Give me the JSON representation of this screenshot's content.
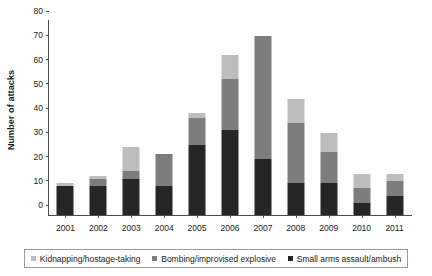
{
  "chart_data": {
    "type": "bar",
    "title": "",
    "subtitle": "",
    "xlabel": "",
    "ylabel": "Number of attacks",
    "stacked": true,
    "grid": false,
    "legend_position": "bottom",
    "ylim": [
      0,
      80
    ],
    "yticks": [
      0,
      10,
      20,
      30,
      40,
      50,
      60,
      70,
      80
    ],
    "categories": [
      "2001",
      "2002",
      "2003",
      "2004",
      "2005",
      "2006",
      "2007",
      "2008",
      "2009",
      "2010",
      "2011"
    ],
    "series": [
      {
        "name": "Small arms assault/ambush",
        "color": "#262626",
        "values": [
          12,
          12,
          15,
          12,
          29,
          35,
          23,
          13,
          13,
          5,
          8
        ]
      },
      {
        "name": "Bombing/improvised explosive",
        "color": "#7d7d7d",
        "values": [
          0,
          3,
          3,
          13,
          11,
          21,
          51,
          25,
          13,
          6,
          6
        ]
      },
      {
        "name": "Kidnapping/hostage-taking",
        "color": "#bdbdbd",
        "values": [
          1,
          1,
          10,
          0,
          2,
          10,
          0,
          10,
          8,
          6,
          3
        ]
      }
    ],
    "totals": [
      13,
      16,
      28,
      25,
      42,
      66,
      74,
      48,
      34,
      17,
      17
    ]
  },
  "legend": {
    "items": [
      {
        "label": "Kidnapping/hostage-taking",
        "color": "#bdbdbd"
      },
      {
        "label": "Bombing/improvised explosive",
        "color": "#7d7d7d"
      },
      {
        "label": "Small arms assault/ambush",
        "color": "#262626"
      }
    ]
  }
}
